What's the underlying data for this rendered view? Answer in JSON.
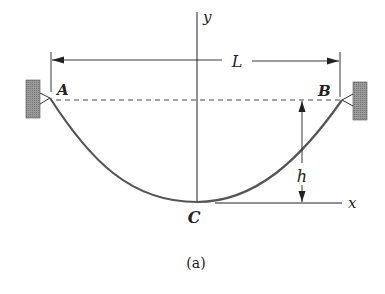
{
  "figure": {
    "caption": "(a)",
    "labels": {
      "y_axis": "y",
      "x_axis": "x",
      "span": "L",
      "sag": "h",
      "support_left": "A",
      "support_right": "B",
      "lowest_point": "C"
    },
    "colors": {
      "cable": "#555555",
      "lines": "#222222",
      "wall_fill": "#8a8a8a"
    }
  }
}
